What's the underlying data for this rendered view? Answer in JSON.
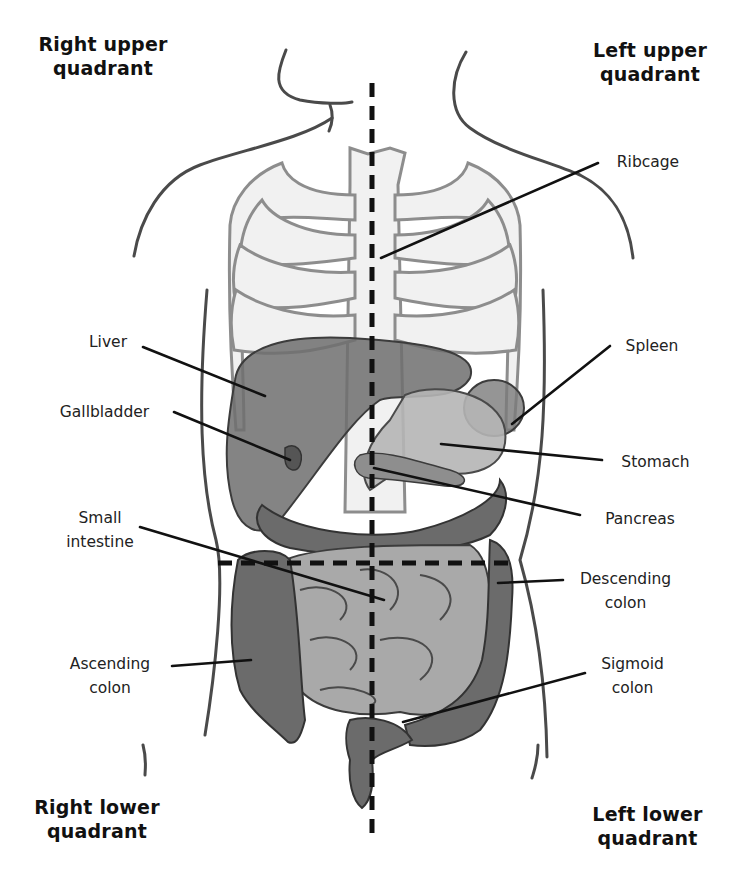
{
  "quadrants": {
    "right_upper": {
      "line1": "Right upper",
      "line2": "quadrant"
    },
    "left_upper": {
      "line1": "Left upper",
      "line2": "quadrant"
    },
    "right_lower": {
      "line1": "Right lower",
      "line2": "quadrant"
    },
    "left_lower": {
      "line1": "Left lower",
      "line2": "quadrant"
    }
  },
  "labels": {
    "ribcage": {
      "line1": "Ribcage"
    },
    "liver": {
      "line1": "Liver"
    },
    "gallbladder": {
      "line1": "Gallbladder"
    },
    "spleen": {
      "line1": "Spleen"
    },
    "stomach": {
      "line1": "Stomach"
    },
    "pancreas": {
      "line1": "Pancreas"
    },
    "small_intestine": {
      "line1": "Small",
      "line2": "intestine"
    },
    "descending_colon": {
      "line1": "Descending",
      "line2": "colon"
    },
    "ascending_colon": {
      "line1": "Ascending",
      "line2": "colon"
    },
    "sigmoid_colon": {
      "line1": "Sigmoid",
      "line2": "colon"
    }
  },
  "colors": {
    "ribcage_fill": "#f1f1f1",
    "ribcage_stroke": "#8d8d8d",
    "liver": "#6e6e6e",
    "stomach": "#b5b5b5",
    "small_intestine": "#a9a9a9",
    "colon": "#6b6b6b",
    "outline": "#4a4a4a",
    "leader_lines": "#111111"
  }
}
